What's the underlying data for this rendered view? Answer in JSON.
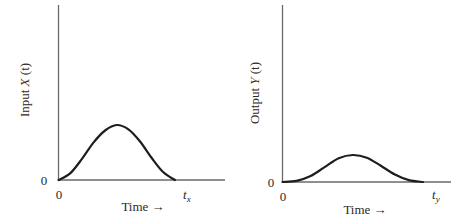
{
  "chart_data": [
    {
      "type": "line",
      "title": "",
      "xlabel": "Time →",
      "ylabel": "Input X(t)",
      "ylabel_parts": {
        "prefix": "Input ",
        "var": "X",
        "arg": "(t)"
      },
      "y_tick_labels": [
        "0"
      ],
      "x_tick_labels": [
        "0",
        "t_x"
      ],
      "x_end_label": {
        "base": "t",
        "sub": "x"
      },
      "xlim": [
        0,
        1.3
      ],
      "ylim": [
        0,
        3.0
      ],
      "grid": false,
      "series": [
        {
          "name": "X(t)",
          "x": [
            0,
            0.1,
            0.2,
            0.3,
            0.4,
            0.5,
            0.6,
            0.7,
            0.8,
            0.9,
            1.0
          ],
          "y": [
            0,
            0.12,
            0.38,
            0.68,
            0.9,
            1.0,
            0.92,
            0.7,
            0.4,
            0.14,
            0
          ]
        }
      ]
    },
    {
      "type": "line",
      "title": "",
      "xlabel": "Time →",
      "ylabel": "Output Y(t)",
      "ylabel_parts": {
        "prefix": "Output ",
        "var": "Y",
        "arg": "(t)"
      },
      "y_tick_labels": [
        "0"
      ],
      "x_tick_labels": [
        "0",
        "t_y"
      ],
      "x_end_label": {
        "base": "t",
        "sub": "y"
      },
      "xlim": [
        0,
        1.2
      ],
      "ylim": [
        0,
        6.3
      ],
      "grid": false,
      "series": [
        {
          "name": "Y(t)",
          "x": [
            0,
            0.1,
            0.2,
            0.3,
            0.4,
            0.5,
            0.6,
            0.7,
            0.8,
            0.9,
            1.0
          ],
          "y": [
            0,
            0.04,
            0.22,
            0.55,
            0.88,
            1.0,
            0.9,
            0.6,
            0.28,
            0.07,
            0
          ]
        }
      ]
    }
  ]
}
